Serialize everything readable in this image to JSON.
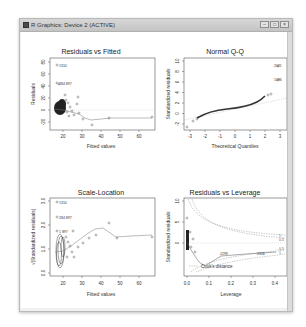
{
  "window": {
    "title": "R Graphics: Device 2 (ACTIVE)",
    "buttons": {
      "minimize": "–",
      "maximize": "□",
      "close": "×"
    }
  },
  "plots": {
    "residuals_vs_fitted": {
      "title": "Residuals vs Fitted",
      "xlabel": "Fitted values",
      "ylabel": "Residuals",
      "xticks": [
        "20",
        "30",
        "40",
        "50",
        "60"
      ],
      "yticks": [
        "80",
        "60",
        "40",
        "20",
        "0",
        "-20"
      ],
      "labels": [
        "1310",
        "284 897"
      ]
    },
    "normal_qq": {
      "title": "Normal Q-Q",
      "xlabel": "Theoretical Quantiles",
      "ylabel": "Standardized residuals",
      "xticks": [
        "-3",
        "-2",
        "-1",
        "0",
        "1",
        "2",
        "3"
      ],
      "yticks": [
        "10",
        "8",
        "6",
        "4",
        "2",
        "0",
        "-2"
      ],
      "labels": [
        "2021",
        "1096"
      ]
    },
    "scale_location": {
      "title": "Scale-Location",
      "xlabel": "Fitted values",
      "ylabel": "√|Standardized residuals|",
      "xticks": [
        "20",
        "30",
        "40",
        "50",
        "60"
      ],
      "yticks": [
        "3.0",
        "2.0",
        "1.0",
        "0.0"
      ],
      "labels": [
        "1310",
        "284 897",
        "1 897"
      ]
    },
    "residuals_vs_leverage": {
      "title": "Residuals vs Leverage",
      "xlabel": "Leverage",
      "ylabel": "Standardized residuals",
      "xticks": [
        "0.0",
        "0.1",
        "0.2",
        "0.3",
        "0.4"
      ],
      "yticks": [
        "10",
        "5",
        "0"
      ],
      "labels": [
        "1",
        "0.5",
        "0.5",
        "1",
        "2299",
        "2316"
      ],
      "legend": "Cook's distance"
    }
  }
}
